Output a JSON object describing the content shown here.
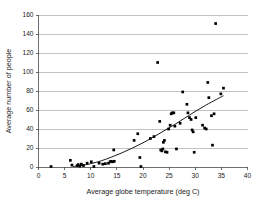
{
  "chart_data": {
    "type": "scatter",
    "title": "",
    "xlabel": "Average globe temperature (deg C)",
    "ylabel": "Average number of people",
    "xlim": [
      0,
      40
    ],
    "ylim": [
      0,
      160
    ],
    "xticks": [
      0,
      5,
      10,
      15,
      20,
      25,
      30,
      35,
      40
    ],
    "yticks": [
      0,
      20,
      40,
      60,
      80,
      100,
      120,
      140,
      160
    ],
    "grid": "horizontal",
    "legend": "none",
    "marker_color": "#000000",
    "trendline_color": "#000000",
    "series": [
      {
        "name": "Observations",
        "marker": "square",
        "points": [
          [
            2.4,
            0.5
          ],
          [
            6.1,
            7.0
          ],
          [
            6.4,
            2.0
          ],
          [
            7.4,
            1.5
          ],
          [
            7.6,
            2.5
          ],
          [
            7.9,
            1.0
          ],
          [
            8.2,
            3.0
          ],
          [
            8.6,
            1.5
          ],
          [
            9.3,
            4.0
          ],
          [
            10.1,
            5.5
          ],
          [
            10.6,
            0.5
          ],
          [
            11.6,
            4.0
          ],
          [
            12.3,
            3.0
          ],
          [
            12.8,
            3.5
          ],
          [
            13.4,
            4.0
          ],
          [
            13.7,
            5.5
          ],
          [
            13.9,
            6.0
          ],
          [
            14.2,
            5.5
          ],
          [
            14.5,
            6.0
          ],
          [
            14.4,
            18.0
          ],
          [
            18.3,
            28.0
          ],
          [
            19.0,
            35.0
          ],
          [
            19.4,
            10.0
          ],
          [
            19.6,
            0.5
          ],
          [
            21.4,
            30.0
          ],
          [
            22.1,
            32.0
          ],
          [
            22.8,
            110.0
          ],
          [
            23.2,
            48.0
          ],
          [
            23.4,
            18.0
          ],
          [
            23.6,
            17.0
          ],
          [
            23.8,
            19.0
          ],
          [
            23.9,
            26.0
          ],
          [
            24.1,
            28.0
          ],
          [
            24.3,
            16.0
          ],
          [
            24.6,
            15.5
          ],
          [
            24.9,
            40.0
          ],
          [
            25.2,
            44.0
          ],
          [
            25.4,
            56.0
          ],
          [
            25.6,
            57.0
          ],
          [
            25.9,
            57.0
          ],
          [
            26.1,
            43.0
          ],
          [
            26.4,
            19.0
          ],
          [
            27.1,
            46.0
          ],
          [
            27.6,
            79.0
          ],
          [
            28.4,
            66.0
          ],
          [
            28.6,
            57.0
          ],
          [
            28.9,
            52.0
          ],
          [
            29.2,
            50.0
          ],
          [
            29.4,
            39.0
          ],
          [
            29.6,
            37.0
          ],
          [
            29.8,
            15.5
          ],
          [
            30.1,
            52.0
          ],
          [
            31.4,
            44.0
          ],
          [
            31.8,
            41.0
          ],
          [
            32.1,
            40.0
          ],
          [
            32.4,
            89.0
          ],
          [
            32.6,
            73.0
          ],
          [
            33.1,
            54.0
          ],
          [
            33.3,
            23.0
          ],
          [
            33.6,
            56.0
          ],
          [
            33.9,
            151.0
          ],
          [
            34.9,
            77.0
          ],
          [
            35.4,
            83.0
          ]
        ]
      }
    ],
    "trendline": {
      "name": "Fitted curve",
      "points": [
        [
          6.6,
          0.5
        ],
        [
          8.0,
          1.5
        ],
        [
          10.0,
          3.5
        ],
        [
          12.0,
          6.5
        ],
        [
          14.0,
          10.5
        ],
        [
          16.0,
          15.0
        ],
        [
          18.0,
          20.0
        ],
        [
          20.0,
          25.5
        ],
        [
          22.0,
          31.5
        ],
        [
          24.0,
          38.0
        ],
        [
          26.0,
          44.5
        ],
        [
          28.0,
          51.5
        ],
        [
          30.0,
          58.5
        ],
        [
          32.0,
          65.0
        ],
        [
          34.0,
          71.0
        ],
        [
          35.4,
          75.0
        ]
      ]
    }
  }
}
